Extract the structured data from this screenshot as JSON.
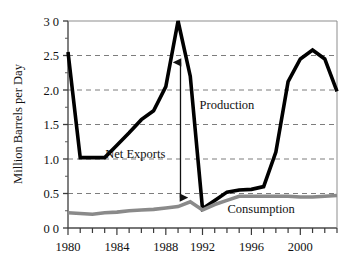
{
  "chart_data": {
    "type": "line",
    "title": "",
    "xlabel": "",
    "ylabel": "Million Barrels per Day",
    "xlim": [
      1980,
      2002
    ],
    "ylim": [
      0.0,
      3.0
    ],
    "grid": true,
    "grid_style": "dashed-horizontal",
    "legend": "none-inline-labels",
    "y_ticks": [
      0.0,
      0.5,
      1.0,
      1.5,
      2.0,
      2.5,
      3.0
    ],
    "y_tick_labels": [
      "0 0",
      "0.5",
      "1.0",
      "1.5",
      "2.0",
      "2.5",
      "3 0"
    ],
    "x_ticks": [
      1980,
      1981,
      1982,
      1983,
      1984,
      1985,
      1986,
      1987,
      1988,
      1989,
      1990,
      1991,
      1992,
      1993,
      1994,
      1995,
      1996,
      1997,
      1998,
      1999,
      2000,
      2001,
      2002
    ],
    "x_tick_labels": [
      "1980",
      "",
      "",
      "",
      "1984",
      "",
      "",
      "",
      "1988",
      "",
      "",
      "1992",
      "",
      "",
      "",
      "1996",
      "",
      "",
      "",
      "2000",
      "",
      "",
      ""
    ],
    "x_major_labels": [
      "1980",
      "1984",
      "1988",
      "1992",
      "1996",
      "2000"
    ],
    "x": [
      1980,
      1981,
      1982,
      1983,
      1984,
      1985,
      1986,
      1987,
      1988,
      1989,
      1990,
      1991,
      1992,
      1993,
      1994,
      1995,
      1996,
      1997,
      1998,
      1999,
      2000,
      2001,
      2002
    ],
    "series": [
      {
        "name": "Production",
        "color": "#000000",
        "width": 3.6,
        "values": [
          2.55,
          1.02,
          1.02,
          1.02,
          1.2,
          1.38,
          1.57,
          1.7,
          2.05,
          3.0,
          2.2,
          0.28,
          0.4,
          0.52,
          0.55,
          0.56,
          0.6,
          1.1,
          2.12,
          2.45,
          2.58,
          2.45,
          1.98
        ]
      },
      {
        "name": "Consumption",
        "color": "#8a8a8a",
        "width": 3.6,
        "values": [
          0.22,
          0.21,
          0.2,
          0.22,
          0.23,
          0.25,
          0.26,
          0.27,
          0.29,
          0.31,
          0.38,
          0.26,
          0.34,
          0.4,
          0.46,
          0.46,
          0.46,
          0.46,
          0.46,
          0.45,
          0.45,
          0.46,
          0.47
        ]
      }
    ],
    "annotations": [
      {
        "name": "production-label",
        "text": "Production",
        "x": 1993.0,
        "y": 1.72
      },
      {
        "name": "consumption-label",
        "text": "Consumption",
        "x": 1995.8,
        "y": 0.22
      },
      {
        "name": "net-exports-label",
        "text": "Net Exports",
        "x": 1985.5,
        "y": 1.02
      },
      {
        "name": "net-exports-arrow",
        "text": "",
        "x": 1989.2,
        "y_top": 2.4,
        "y_bottom": 0.44,
        "double_headed": true
      }
    ]
  },
  "axis": {
    "y_title": "Million Barrels per Day"
  }
}
